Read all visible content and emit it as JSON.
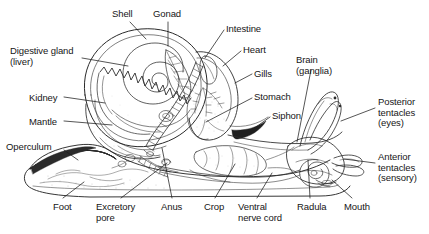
{
  "figure": {
    "background_color": "#ffffff",
    "line_color": "#2b2b2b",
    "text_color": "#161616",
    "width": 429,
    "height": 234
  },
  "labels": [
    {
      "id": "digestive-gland",
      "text": "Digestive gland\n(liver)",
      "x": 10,
      "y": 46,
      "align": "l"
    },
    {
      "id": "kidney",
      "text": "Kidney",
      "x": 29,
      "y": 93,
      "align": "l"
    },
    {
      "id": "mantle",
      "text": "Mantle",
      "x": 29,
      "y": 117,
      "align": "l"
    },
    {
      "id": "operculum",
      "text": "Operculum",
      "x": 6,
      "y": 142,
      "align": "l"
    },
    {
      "id": "shell",
      "text": "Shell",
      "x": 112,
      "y": 9,
      "align": "l"
    },
    {
      "id": "gonad",
      "text": "Gonad",
      "x": 153,
      "y": 9,
      "align": "l"
    },
    {
      "id": "intestine",
      "text": "Intestine",
      "x": 226,
      "y": 24,
      "align": "l"
    },
    {
      "id": "heart",
      "text": "Heart",
      "x": 243,
      "y": 45,
      "align": "l"
    },
    {
      "id": "gills",
      "text": "Gills",
      "x": 254,
      "y": 69,
      "align": "l"
    },
    {
      "id": "stomach",
      "text": "Stomach",
      "x": 254,
      "y": 92,
      "align": "l"
    },
    {
      "id": "siphon",
      "text": "Siphon",
      "x": 272,
      "y": 111,
      "align": "l"
    },
    {
      "id": "brain",
      "text": "Brain\n(ganglia)",
      "x": 296,
      "y": 55,
      "align": "l"
    },
    {
      "id": "posterior-tentacles",
      "text": "Posterior\ntentacles\n(eyes)",
      "x": 378,
      "y": 97,
      "align": "l"
    },
    {
      "id": "anterior-tentacles",
      "text": "Anterior\ntentacles\n(sensory)",
      "x": 378,
      "y": 152,
      "align": "l"
    },
    {
      "id": "foot",
      "text": "Foot",
      "x": 53,
      "y": 202,
      "align": "l"
    },
    {
      "id": "excretory-pore",
      "text": "Excretory\npore",
      "x": 96,
      "y": 202,
      "align": "l"
    },
    {
      "id": "anus",
      "text": "Anus",
      "x": 161,
      "y": 202,
      "align": "l"
    },
    {
      "id": "crop",
      "text": "Crop",
      "x": 204,
      "y": 202,
      "align": "l"
    },
    {
      "id": "ventral-nerve-cord",
      "text": "Ventral\nnerve cord",
      "x": 238,
      "y": 202,
      "align": "l"
    },
    {
      "id": "radula",
      "text": "Radula",
      "x": 297,
      "y": 202,
      "align": "l"
    },
    {
      "id": "mouth",
      "text": "Mouth",
      "x": 344,
      "y": 202,
      "align": "l"
    }
  ],
  "leader_lines": [
    {
      "id": "leader-shell",
      "points": "130,22 146,39"
    },
    {
      "id": "leader-gonad",
      "points": "168,22 168,46"
    },
    {
      "id": "leader-digestive-gland",
      "points": "82,58 128,66"
    },
    {
      "id": "leader-kidney",
      "points": "64,97 105,103"
    },
    {
      "id": "leader-mantle",
      "points": "64,121 112,125"
    },
    {
      "id": "leader-operculum",
      "points": "64,150 78,160"
    },
    {
      "id": "leader-intestine",
      "points": "224,30 205,58"
    },
    {
      "id": "leader-heart",
      "points": "241,51 223,66"
    },
    {
      "id": "leader-gills",
      "points": "252,74 235,83"
    },
    {
      "id": "leader-stomach",
      "points": "252,98 206,122"
    },
    {
      "id": "leader-siphon",
      "points": "270,117 256,127"
    },
    {
      "id": "leader-brain",
      "points": "311,70 297,142"
    },
    {
      "id": "leader-posterior-tentacles",
      "points": "375,108 341,121"
    },
    {
      "id": "leader-anterior-tentacles",
      "points": "375,163 344,159"
    },
    {
      "id": "leader-foot",
      "points": "63,198 84,182"
    },
    {
      "id": "leader-excretory-pore",
      "points": "121,198 167,163"
    },
    {
      "id": "leader-anus",
      "points": "172,198 162,148"
    },
    {
      "id": "leader-crop",
      "points": "215,198 235,164"
    },
    {
      "id": "leader-ventral-nerve-cord",
      "points": "257,198 272,173"
    },
    {
      "id": "leader-radula",
      "points": "310,198 308,160"
    },
    {
      "id": "leader-mouth",
      "points": "352,198 332,180"
    }
  ]
}
